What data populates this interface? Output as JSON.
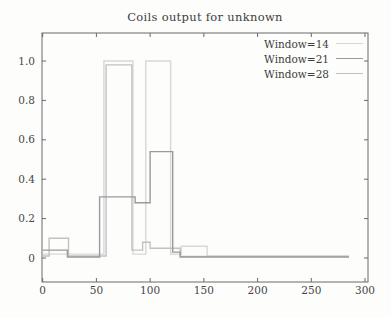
{
  "title": "Coils output for unknown",
  "chart_data": {
    "type": "line",
    "title": "Coils output for unknown",
    "subtitle": "",
    "xlabel": "",
    "ylabel": "",
    "xlim": [
      0,
      302
    ],
    "ylim": [
      0,
      1.14
    ],
    "grid": false,
    "legend_position": "top-right",
    "line_style": "step-after",
    "x_ticks": [
      0,
      50,
      100,
      150,
      200,
      250,
      300
    ],
    "x_tick_labels": [
      "0",
      "50",
      "100",
      "150",
      "200",
      "250",
      "300"
    ],
    "y_ticks": [
      0,
      0.2,
      0.4,
      0.6,
      0.8,
      1.0
    ],
    "y_tick_labels": [
      "0",
      "0.2",
      "0.4",
      "0.6",
      "0.8",
      "1.0"
    ],
    "frame_color": "#6a6a6a",
    "text_color": "#474747",
    "series": [
      {
        "name": "Window=14",
        "color": "#d8d8d8",
        "points": [
          [
            0,
            0.02
          ],
          [
            57,
            1.0
          ],
          [
            84,
            0.02
          ],
          [
            96,
            1.0
          ],
          [
            119,
            0.02
          ],
          [
            129,
            0.06
          ],
          [
            153,
            0.01
          ],
          [
            285,
            0.01
          ]
        ]
      },
      {
        "name": "Window=21",
        "color": "#9a9a9a",
        "points": [
          [
            0,
            0.04
          ],
          [
            23,
            0.005
          ],
          [
            53,
            0.31
          ],
          [
            86,
            0.28
          ],
          [
            100,
            0.54
          ],
          [
            121,
            0.03
          ],
          [
            128,
            0.005
          ],
          [
            285,
            0.005
          ]
        ]
      },
      {
        "name": "Window=28",
        "color": "#c2c2c2",
        "points": [
          [
            0,
            0.01
          ],
          [
            6,
            0.1
          ],
          [
            24,
            0.01
          ],
          [
            59,
            0.98
          ],
          [
            83,
            0.04
          ],
          [
            93,
            0.08
          ],
          [
            100,
            0.05
          ],
          [
            128,
            0.008
          ],
          [
            285,
            0.008
          ]
        ]
      }
    ]
  }
}
